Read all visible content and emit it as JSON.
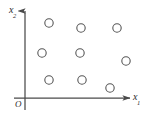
{
  "figure": {
    "type": "scatter-coordinate-diagram",
    "background_color": "#ffffff",
    "axis_color": "#4a4a4a",
    "point_color": "#555555",
    "labels": {
      "x_axis": "x",
      "x_axis_subscript": "1",
      "y_axis": "x",
      "y_axis_subscript": "2",
      "origin": "O"
    }
  },
  "chart_data": {
    "type": "scatter",
    "title": "",
    "xlabel": "x1",
    "ylabel": "x2",
    "xlim": [
      0,
      149
    ],
    "ylim": [
      0,
      118
    ],
    "grid": false,
    "legend": null,
    "marker": "open-circle",
    "point_count": 9,
    "series": [
      {
        "name": "points",
        "marker": "open-circle",
        "radius": 4.2,
        "points": [
          {
            "cx": 49,
            "cy": 23
          },
          {
            "cx": 81,
            "cy": 28
          },
          {
            "cx": 117,
            "cy": 28
          },
          {
            "cx": 42,
            "cy": 53
          },
          {
            "cx": 80,
            "cy": 53
          },
          {
            "cx": 126,
            "cy": 61
          },
          {
            "cx": 49,
            "cy": 80
          },
          {
            "cx": 82,
            "cy": 80
          },
          {
            "cx": 110,
            "cy": 88
          }
        ]
      }
    ],
    "axes_geometry": {
      "y_axis_x": 25,
      "y_axis_top": 9,
      "y_axis_bottom": 110,
      "x_axis_y": 98,
      "x_axis_left": 14,
      "x_axis_right": 133,
      "arrowheads": [
        "y-axis-top",
        "x-axis-right"
      ]
    }
  }
}
